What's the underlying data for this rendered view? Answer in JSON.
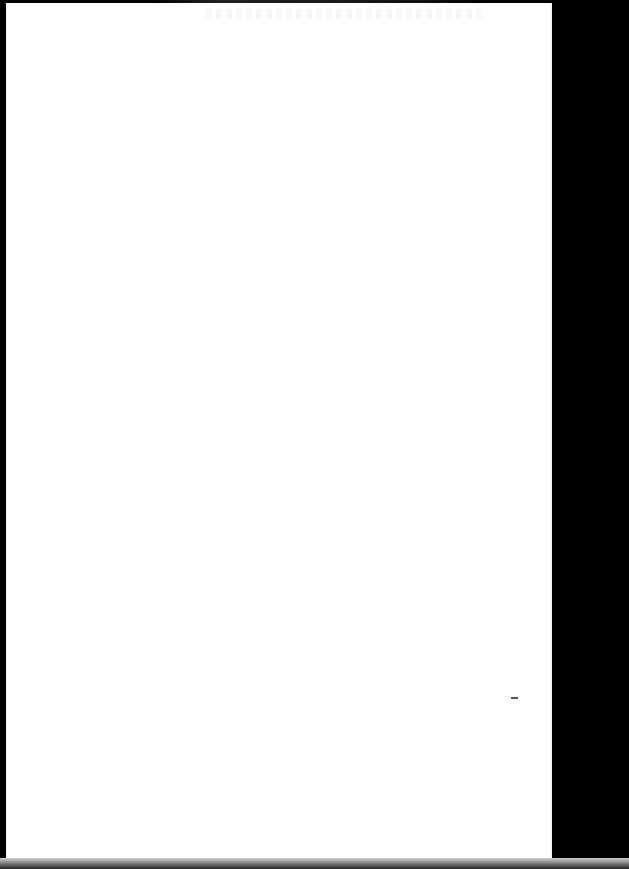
{
  "document": {
    "type": "scanned-page",
    "content": "",
    "page_color": "#ffffff",
    "background_color": "#000000",
    "notes": []
  }
}
